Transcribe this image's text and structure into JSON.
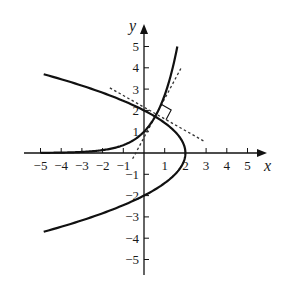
{
  "figure": {
    "x_axis_label": "x",
    "y_axis_label": "y",
    "x_tick_labels": [
      "-5",
      "-4",
      "-3",
      "-2",
      "-1",
      "1",
      "2",
      "3",
      "4",
      "5"
    ],
    "y_tick_labels": [
      "5",
      "4",
      "3",
      "2",
      "1",
      "-1",
      "-2",
      "-3",
      "-4",
      "-5"
    ],
    "colors": {
      "curve": "#111111",
      "axis": "#111111",
      "tangent": "#333333",
      "background": "#ffffff"
    }
  },
  "mapping": {
    "origin_px": [
      144,
      153
    ],
    "x_scale": 20.7,
    "y_scale": 21.3
  },
  "curves": {
    "exponential": {
      "equation": "y = e^x",
      "x_range": [
        -5,
        1.61
      ]
    },
    "parabola": {
      "equation": "x = 2 - y^2/2",
      "y_range": [
        -3.7,
        3.7
      ]
    }
  },
  "intersection": {
    "x": 0.6,
    "y": 1.82
  },
  "tangents": [
    {
      "name": "tangent-to-exponential",
      "slope": 1.82,
      "x_range": [
        -0.55,
        1.78
      ]
    },
    {
      "name": "tangent-to-parabola",
      "slope": -0.55,
      "x_range": [
        -1.65,
        2.95
      ]
    }
  ],
  "right_angle_marker": true
}
